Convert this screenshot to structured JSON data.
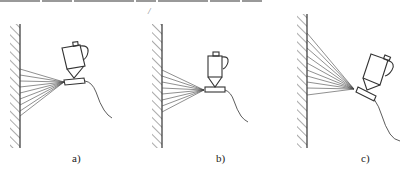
{
  "figure": {
    "subfigures": [
      {
        "id": "a",
        "label": "a)",
        "gun_orientation": "tilted-left",
        "description": "spray gun angled slightly toward wall, fan spray hitting wall"
      },
      {
        "id": "b",
        "label": "b)",
        "gun_orientation": "upright",
        "description": "spray gun held perpendicular to wall, symmetric fan spray"
      },
      {
        "id": "c",
        "label": "c)",
        "gun_orientation": "tilted-back",
        "description": "spray gun tilted back, spray fan spread upward along wall"
      }
    ],
    "stray_mark": "/",
    "colors": {
      "line": "#333333",
      "background": "#ffffff"
    }
  }
}
